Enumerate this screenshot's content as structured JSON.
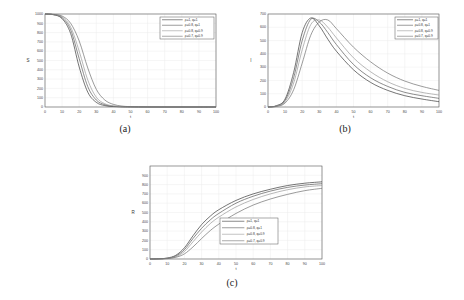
{
  "chart_data": [
    {
      "id": "a",
      "type": "line",
      "caption": "(a)",
      "title": "",
      "xlabel": "t",
      "ylabel": "S",
      "xlim": [
        0,
        100
      ],
      "ylim": [
        0,
        1000
      ],
      "xticks": [
        0,
        10,
        20,
        30,
        40,
        50,
        60,
        70,
        80,
        90,
        100
      ],
      "yticks": [
        0,
        100,
        200,
        300,
        400,
        500,
        600,
        700,
        800,
        900,
        1000
      ],
      "grid": true,
      "legend_position": "upper right",
      "x": [
        0,
        5,
        10,
        15,
        20,
        25,
        30,
        35,
        40,
        45,
        50,
        60,
        70,
        80,
        90,
        100
      ],
      "series": [
        {
          "name": "ρ=1, q=1",
          "values": [
            1000,
            992,
            950,
            790,
            430,
            160,
            50,
            15,
            5,
            2,
            1,
            0,
            0,
            0,
            0,
            0
          ]
        },
        {
          "name": "ρ=0.8, q=1",
          "values": [
            1000,
            993,
            960,
            830,
            520,
            220,
            75,
            25,
            8,
            3,
            1,
            0,
            0,
            0,
            0,
            0
          ]
        },
        {
          "name": "ρ=0.8, q=0.9",
          "values": [
            1000,
            994,
            968,
            860,
            600,
            290,
            105,
            35,
            12,
            4,
            2,
            0,
            0,
            0,
            0,
            0
          ]
        },
        {
          "name": "ρ=0.7, q=0.9",
          "values": [
            1000,
            996,
            978,
            900,
            710,
            420,
            190,
            75,
            28,
            10,
            4,
            1,
            0,
            0,
            0,
            0
          ]
        }
      ]
    },
    {
      "id": "b",
      "type": "line",
      "caption": "(b)",
      "title": "",
      "xlabel": "t",
      "ylabel": "I",
      "xlim": [
        0,
        100
      ],
      "ylim": [
        0,
        700
      ],
      "xticks": [
        0,
        10,
        20,
        30,
        40,
        50,
        60,
        70,
        80,
        90,
        100
      ],
      "yticks": [
        0,
        100,
        200,
        300,
        400,
        500,
        600,
        700
      ],
      "grid": true,
      "legend_position": "upper right",
      "x": [
        0,
        5,
        10,
        15,
        20,
        25,
        30,
        35,
        40,
        50,
        60,
        70,
        80,
        90,
        100
      ],
      "series": [
        {
          "name": "ρ=1, q=1",
          "values": [
            0,
            10,
            60,
            260,
            560,
            670,
            610,
            510,
            420,
            280,
            185,
            125,
            85,
            60,
            40
          ]
        },
        {
          "name": "ρ=0.8, q=1",
          "values": [
            0,
            8,
            50,
            220,
            500,
            660,
            640,
            560,
            470,
            320,
            220,
            155,
            110,
            85,
            65
          ]
        },
        {
          "name": "ρ=0.8, q=0.9",
          "values": [
            0,
            6,
            40,
            180,
            430,
            620,
            655,
            600,
            520,
            370,
            265,
            190,
            140,
            110,
            90
          ]
        },
        {
          "name": "ρ=0.7, q=0.9",
          "values": [
            0,
            4,
            30,
            130,
            330,
            540,
            640,
            655,
            590,
            450,
            340,
            255,
            195,
            155,
            125
          ]
        }
      ]
    },
    {
      "id": "c",
      "type": "line",
      "caption": "(c)",
      "title": "",
      "xlabel": "t",
      "ylabel": "R",
      "xlim": [
        0,
        100
      ],
      "ylim": [
        0,
        1000
      ],
      "xticks": [
        0,
        10,
        20,
        30,
        40,
        50,
        60,
        70,
        80,
        90,
        100
      ],
      "yticks": [
        0,
        100,
        200,
        300,
        400,
        500,
        600,
        700,
        800,
        900
      ],
      "grid": true,
      "legend_position": "center",
      "x": [
        0,
        5,
        10,
        15,
        20,
        25,
        30,
        35,
        40,
        50,
        60,
        70,
        80,
        90,
        100
      ],
      "series": [
        {
          "name": "ρ=1, q=1",
          "values": [
            0,
            2,
            10,
            40,
            120,
            250,
            370,
            460,
            530,
            630,
            700,
            750,
            790,
            815,
            830
          ]
        },
        {
          "name": "ρ=0.8, q=1",
          "values": [
            0,
            2,
            8,
            32,
            100,
            220,
            330,
            420,
            490,
            600,
            675,
            730,
            770,
            795,
            810
          ]
        },
        {
          "name": "ρ=0.8, q=0.9",
          "values": [
            0,
            1,
            6,
            25,
            80,
            185,
            290,
            380,
            450,
            560,
            640,
            700,
            745,
            775,
            790
          ]
        },
        {
          "name": "ρ=0.7, q=0.9",
          "values": [
            0,
            1,
            4,
            18,
            55,
            130,
            220,
            305,
            375,
            490,
            580,
            645,
            695,
            735,
            760
          ]
        }
      ]
    }
  ],
  "series_colors": [
    "#3a3a3a",
    "#5a5a5a",
    "#9a9a9a",
    "#707070"
  ],
  "captions": {
    "a": "(a)",
    "b": "(b)",
    "c": "(c)"
  }
}
